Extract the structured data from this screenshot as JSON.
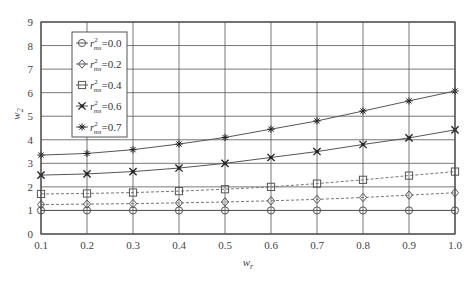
{
  "chart_data": {
    "type": "line",
    "title": "",
    "xlabel": "w_r",
    "ylabel": "w_2",
    "xlabel_main": "w",
    "xlabel_sub": "r",
    "ylabel_main": "w",
    "ylabel_sub": "2",
    "x": [
      0.1,
      0.2,
      0.3,
      0.4,
      0.5,
      0.6,
      0.7,
      0.8,
      0.9,
      1.0
    ],
    "xlim": [
      0.1,
      1.0
    ],
    "ylim": [
      0,
      9
    ],
    "xticks": [
      "0.1",
      "0.2",
      "0.3",
      "0.4",
      "0.5",
      "0.6",
      "0.7",
      "0.8",
      "0.9",
      "1.0"
    ],
    "yticks": [
      "0",
      "1",
      "2",
      "3",
      "4",
      "5",
      "6",
      "7",
      "8",
      "9"
    ],
    "grid": true,
    "legend_position": "upper left",
    "series": [
      {
        "name": "r²ms = 0.0",
        "label_main": "r",
        "label_sup": "2",
        "label_sub": "ms",
        "label_val": "=0.0",
        "marker": "circle",
        "line": "solid",
        "values": [
          1.0,
          1.0,
          1.0,
          1.0,
          1.0,
          1.0,
          1.0,
          1.0,
          1.0,
          1.0
        ]
      },
      {
        "name": "r²ms = 0.2",
        "label_main": "r",
        "label_sup": "2",
        "label_sub": "ms",
        "label_val": "=0.2",
        "marker": "diamond",
        "line": "dashed",
        "values": [
          1.25,
          1.27,
          1.29,
          1.32,
          1.36,
          1.41,
          1.47,
          1.55,
          1.65,
          1.75
        ]
      },
      {
        "name": "r²ms = 0.4",
        "label_main": "r",
        "label_sup": "2",
        "label_sub": "ms",
        "label_val": "=0.4",
        "marker": "square",
        "line": "dashed",
        "values": [
          1.7,
          1.72,
          1.76,
          1.82,
          1.9,
          2.0,
          2.14,
          2.3,
          2.48,
          2.65
        ]
      },
      {
        "name": "r²ms = 0.6",
        "label_main": "r",
        "label_sup": "2",
        "label_sub": "ms",
        "label_val": "=0.6",
        "marker": "x",
        "line": "solid",
        "values": [
          2.5,
          2.55,
          2.65,
          2.8,
          3.0,
          3.25,
          3.5,
          3.8,
          4.08,
          4.42
        ]
      },
      {
        "name": "r²ms = 0.7",
        "label_main": "r",
        "label_sup": "2",
        "label_sub": "ms",
        "label_val": "=0.7",
        "marker": "star",
        "line": "solid",
        "values": [
          3.35,
          3.42,
          3.58,
          3.82,
          4.1,
          4.45,
          4.8,
          5.22,
          5.65,
          6.07
        ]
      }
    ]
  },
  "colors": {
    "axis": "#444444",
    "grid": "#555555",
    "line": "#555555",
    "dashed": "#777777",
    "background": "#ffffff"
  }
}
